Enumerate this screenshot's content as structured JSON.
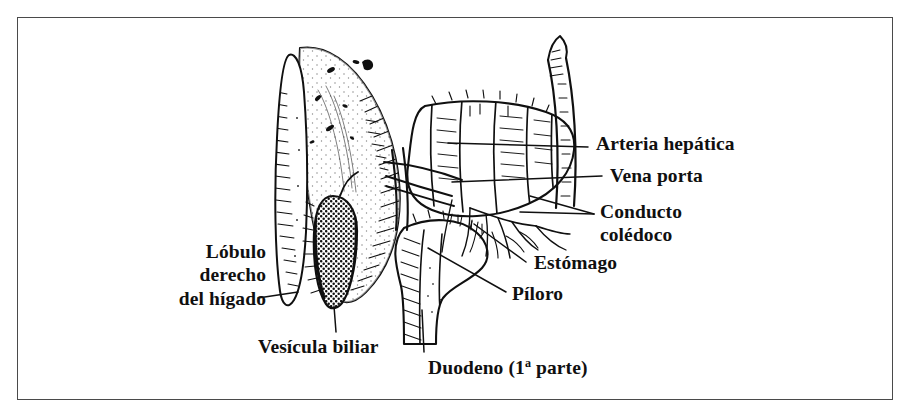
{
  "figure": {
    "kind": "anatomical-line-drawing",
    "style": "grabado / line engraving con trama y punteado",
    "background_color": "#ffffff",
    "ink_color": "#101010",
    "border_color": "#4a4a4a"
  },
  "labels": {
    "arteria_hepatica": "Arteria hepática",
    "vena_porta": "Vena porta",
    "conducto_line1": "Conducto",
    "conducto_line2": "colédoco",
    "estomago": "Estómago",
    "piloro": "Píloro",
    "lobulo_line1": "Lóbulo",
    "lobulo_line2": "derecho",
    "lobulo_line3": "del hígado",
    "vesicula_biliar": "Vesícula biliar",
    "duodeno_pre": "Duodeno (1",
    "duodeno_ord": "a",
    "duodeno_post": " parte)"
  }
}
